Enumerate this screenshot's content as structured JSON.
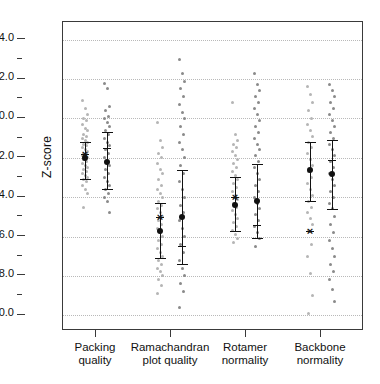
{
  "chart_data": {
    "type": "scatter",
    "title": "",
    "xlabel": "",
    "ylabel": "Z-score",
    "ylim": [
      -10.8,
      4.9
    ],
    "yticks_major": [
      4.0,
      2.0,
      0.0,
      -2.0,
      -4.0,
      -6.0,
      -8.0,
      -10.0
    ],
    "yticks_major_labels": [
      "4.0",
      "2.0",
      "0.0",
      "-2.0",
      "-4.0",
      "-6.0",
      "-8.0",
      "-10.0"
    ],
    "yticks_minor": [
      3.0,
      1.0,
      -1.0,
      -3.0,
      -5.0,
      -7.0,
      -9.0
    ],
    "grid": "horizontal-dotted",
    "legend": "none",
    "categories": [
      "Packing quality",
      "Ramachandran plot quality",
      "Rotamer normality",
      "Backbone normality"
    ],
    "series": [
      {
        "name": "light",
        "color": "#b5b5b5",
        "marker_color": "#111111",
        "groups": [
          {
            "category": "Packing quality",
            "mean": -2.0,
            "err_low": -3.1,
            "err_high": -1.2,
            "median": -1.8,
            "points": [
              0.9,
              0.5,
              0.2,
              0.0,
              -0.1,
              -0.3,
              -0.5,
              -0.6,
              -0.8,
              -0.9,
              -1.0,
              -1.1,
              -1.2,
              -1.3,
              -1.4,
              -1.5,
              -1.6,
              -1.7,
              -1.8,
              -1.8,
              -1.9,
              -2.0,
              -2.0,
              -2.1,
              -2.2,
              -2.3,
              -2.4,
              -2.5,
              -2.6,
              -2.7,
              -2.8,
              -2.9,
              -3.0,
              -3.1,
              -3.2,
              -3.4,
              -3.6,
              -3.8,
              -4.5
            ]
          },
          {
            "category": "Ramachandran plot quality",
            "mean": -5.7,
            "err_low": -7.1,
            "err_high": -4.3,
            "median": -5.0,
            "points": [
              -0.2,
              -1.1,
              -1.5,
              -1.8,
              -2.0,
              -2.3,
              -2.6,
              -2.8,
              -3.1,
              -3.4,
              -3.6,
              -3.8,
              -4.0,
              -4.2,
              -4.4,
              -4.6,
              -4.8,
              -5.0,
              -5.2,
              -5.4,
              -5.6,
              -5.8,
              -6.0,
              -6.2,
              -6.4,
              -6.6,
              -6.8,
              -7.0,
              -7.2,
              -7.4,
              -7.6,
              -7.8,
              -8.0,
              -8.2,
              -8.5,
              -8.9
            ]
          },
          {
            "category": "Rotamer normality",
            "mean": -4.4,
            "err_low": -5.7,
            "err_high": -3.0,
            "median": -4.0,
            "points": [
              0.8,
              -0.8,
              -1.1,
              -1.3,
              -1.5,
              -1.7,
              -1.9,
              -2.1,
              -2.3,
              -2.5,
              -2.7,
              -2.9,
              -3.1,
              -3.3,
              -3.5,
              -3.7,
              -3.9,
              -4.1,
              -4.3,
              -4.5,
              -4.7,
              -4.9,
              -5.1,
              -5.3,
              -5.5,
              -5.7,
              -5.9,
              -6.1,
              -6.3
            ]
          },
          {
            "category": "Backbone normality",
            "mean": -2.6,
            "err_low": -4.2,
            "err_high": -1.2,
            "median": -5.7,
            "points": [
              1.6,
              1.2,
              0.8,
              0.4,
              0.0,
              -0.3,
              -0.6,
              -0.9,
              -1.2,
              -1.5,
              -1.8,
              -2.1,
              -2.4,
              -2.7,
              -3.0,
              -3.3,
              -3.6,
              -3.9,
              -4.2,
              -4.5,
              -4.8,
              -5.1,
              -5.4,
              -5.7,
              -6.4,
              -7.0,
              -7.9,
              -9.0,
              -9.9
            ]
          }
        ]
      },
      {
        "name": "dark",
        "color": "#8a8a8a",
        "marker_color": "#111111",
        "groups": [
          {
            "category": "Packing quality",
            "mean": -2.2,
            "err_low": -3.6,
            "err_high": -0.7,
            "median": -1.5,
            "points": [
              1.8,
              1.5,
              0.6,
              0.4,
              0.1,
              0.0,
              -0.2,
              -0.4,
              -0.6,
              -0.8,
              -1.0,
              -1.2,
              -1.4,
              -1.6,
              -1.8,
              -2.0,
              -2.2,
              -2.4,
              -2.6,
              -2.8,
              -3.0,
              -3.2,
              -3.4,
              -3.6,
              -3.8,
              -4.0,
              -4.2,
              -4.8
            ]
          },
          {
            "category": "Ramachandran plot quality",
            "mean": -5.0,
            "err_low": -7.4,
            "err_high": -2.6,
            "median": -6.5,
            "points": [
              3.0,
              2.3,
              1.9,
              1.5,
              1.1,
              0.7,
              0.3,
              0.0,
              -0.4,
              -0.8,
              -1.2,
              -1.6,
              -2.0,
              -2.4,
              -2.8,
              -3.2,
              -3.6,
              -4.0,
              -4.4,
              -4.8,
              -5.2,
              -5.6,
              -6.0,
              -6.4,
              -6.8,
              -7.2,
              -7.6,
              -8.0,
              -8.4,
              -8.8,
              -9.6
            ]
          },
          {
            "category": "Rotamer normality",
            "mean": -4.2,
            "err_low": -6.1,
            "err_high": -2.3,
            "median": -5.4,
            "points": [
              2.3,
              1.7,
              1.4,
              1.1,
              0.8,
              0.5,
              0.2,
              -0.1,
              -0.4,
              -0.7,
              -1.0,
              -1.3,
              -1.6,
              -1.9,
              -2.2,
              -2.5,
              -2.8,
              -3.1,
              -3.4,
              -3.7,
              -4.0,
              -4.3,
              -4.6,
              -4.9,
              -5.2,
              -5.5,
              -5.8,
              -6.1,
              -6.5
            ]
          },
          {
            "category": "Backbone normality",
            "mean": -2.8,
            "err_low": -4.6,
            "err_high": -1.1,
            "median": -2.1,
            "points": [
              1.7,
              1.4,
              1.1,
              0.8,
              0.5,
              0.2,
              -0.1,
              -0.4,
              -0.7,
              -1.0,
              -1.3,
              -1.6,
              -1.9,
              -2.2,
              -2.5,
              -2.8,
              -3.1,
              -3.4,
              -3.7,
              -4.0,
              -4.3,
              -4.6,
              -5.0,
              -5.4,
              -5.8,
              -6.2,
              -6.6,
              -7.0,
              -7.4,
              -7.8,
              -8.2,
              -8.7,
              -9.3
            ]
          }
        ]
      }
    ]
  },
  "axis": {
    "y_title": "Z-score"
  },
  "colors": {
    "frame": "#3a3a3a",
    "grid": "#b9b9b9",
    "light_series": "#b5b5b5",
    "dark_series": "#8a8a8a",
    "marker": "#111111"
  }
}
